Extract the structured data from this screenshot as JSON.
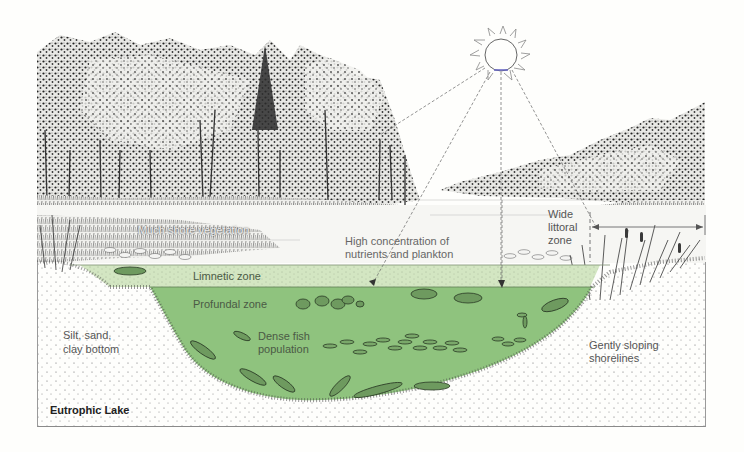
{
  "figure": {
    "title": "Eutrophic Lake",
    "colors": {
      "limnetic_fill": "#cfe3bd",
      "profundal_fill": "#8fc37e",
      "sediment_dots": "#555555",
      "sky": "#fefefc",
      "frame": "#9a9a9a"
    },
    "labels": {
      "shore_vegetation": "Much shore vegetation",
      "nutrients_line1": "High concentration of",
      "nutrients_line2": "nutrients and plankton",
      "limnetic": "Limnetic zone",
      "profundal": "Profundal zone",
      "fish_line1": "Dense fish",
      "fish_line2": "population",
      "bottom_line1": "Silt, sand,",
      "bottom_line2": "clay bottom",
      "littoral_line1": "Wide",
      "littoral_line2": "littoral",
      "littoral_line3": "zone",
      "shore_line1": "Gently sloping",
      "shore_line2": "shorelines"
    },
    "icons": {
      "sun": "sun-icon",
      "fish": "fish-icon",
      "trees": "forest-illustration",
      "reeds": "cattail-reeds-illustration",
      "lily_pads": "lily-pad-icon"
    }
  }
}
